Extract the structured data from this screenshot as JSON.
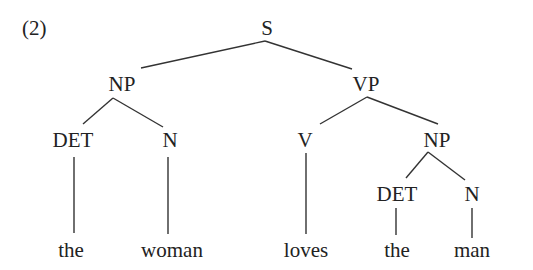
{
  "example_number": "(2)",
  "tree": {
    "root": "S",
    "nodes": {
      "s": "S",
      "np_subject": "NP",
      "vp": "VP",
      "det_subject": "DET",
      "n_subject": "N",
      "v": "V",
      "np_object": "NP",
      "det_object": "DET",
      "n_object": "N"
    },
    "words": [
      "the",
      "woman",
      "loves",
      "the",
      "man"
    ],
    "structure": "[S [NP [DET the] [N woman]] [VP [V loves] [NP [DET the] [N man]]]]"
  },
  "colors": {
    "text": "#222222",
    "lines": "#333333",
    "background": "#ffffff"
  }
}
